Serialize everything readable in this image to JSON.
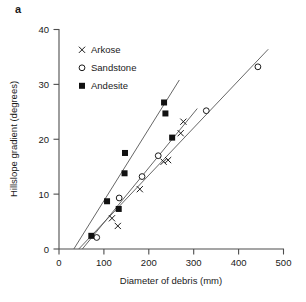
{
  "figure": {
    "panel_label": "a"
  },
  "chart_data": {
    "type": "scatter",
    "title": "",
    "xlabel": "Diameter of debris (mm)",
    "ylabel": "Hillslope gradient (degrees)",
    "xlim": [
      0,
      500
    ],
    "ylim": [
      0,
      40
    ],
    "xticks": [
      0,
      100,
      200,
      300,
      400,
      500
    ],
    "yticks": [
      0,
      10,
      20,
      30,
      40
    ],
    "xtick_labels": [
      "0",
      "100",
      "200",
      "300",
      "400",
      "500"
    ],
    "ytick_labels": [
      "0",
      "10",
      "20",
      "30",
      "40"
    ],
    "grid": false,
    "legend_position": "upper-left",
    "series": [
      {
        "name": "Arkose",
        "marker": "cross",
        "marker_color": "#1a1a1a",
        "points": [
          {
            "x": 118,
            "y": 5.6
          },
          {
            "x": 131,
            "y": 4.2
          },
          {
            "x": 180,
            "y": 10.9
          },
          {
            "x": 233,
            "y": 15.9
          },
          {
            "x": 243,
            "y": 16.2
          },
          {
            "x": 271,
            "y": 21.1
          },
          {
            "x": 277,
            "y": 23.2
          }
        ],
        "trend_line": {
          "x_start": 52,
          "y_start": 0,
          "x_end": 308,
          "y_end": 25.6
        }
      },
      {
        "name": "Sandstone",
        "marker": "open-circle",
        "marker_color": "#1a1a1a",
        "points": [
          {
            "x": 84,
            "y": 2.1
          },
          {
            "x": 134,
            "y": 9.3
          },
          {
            "x": 185,
            "y": 13.2
          },
          {
            "x": 221,
            "y": 17.0
          },
          {
            "x": 328,
            "y": 25.2
          },
          {
            "x": 443,
            "y": 33.2
          }
        ],
        "trend_line": {
          "x_start": 44,
          "y_start": 0,
          "x_end": 466,
          "y_end": 36.4
        }
      },
      {
        "name": "Andesite",
        "marker": "filled-square",
        "marker_color": "#111111",
        "points": [
          {
            "x": 72,
            "y": 2.4
          },
          {
            "x": 107,
            "y": 8.7
          },
          {
            "x": 133,
            "y": 7.3
          },
          {
            "x": 146,
            "y": 13.8
          },
          {
            "x": 147,
            "y": 17.5
          },
          {
            "x": 234,
            "y": 26.7
          },
          {
            "x": 237,
            "y": 24.7
          },
          {
            "x": 252,
            "y": 20.3
          }
        ],
        "trend_line": {
          "x_start": 33,
          "y_start": 0,
          "x_end": 268,
          "y_end": 30.8
        }
      }
    ]
  },
  "legend": {
    "items": [
      {
        "label": "Arkose",
        "marker": "cross"
      },
      {
        "label": "Sandstone",
        "marker": "open-circle"
      },
      {
        "label": "Andesite",
        "marker": "filled-square"
      }
    ]
  }
}
